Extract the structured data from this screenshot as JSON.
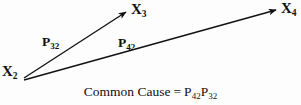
{
  "figure": {
    "background_color": "#fdfdfd",
    "ink_color": "#111111",
    "width": 301,
    "height": 105
  },
  "nodes": [
    {
      "id": "x2",
      "base": "X",
      "subscript": "2",
      "x": 2,
      "y": 64
    },
    {
      "id": "x3",
      "base": "X",
      "subscript": "3",
      "x": 131,
      "y": 2
    },
    {
      "id": "x4",
      "base": "X",
      "subscript": "4",
      "x": 281,
      "y": 1
    }
  ],
  "edges": [
    {
      "id": "edge-x2-x3",
      "label_base": "P",
      "label_subscript": "32",
      "from": "x2",
      "to": "x3",
      "x1": 24,
      "y1": 78,
      "x2": 126,
      "y2": 12,
      "arrowhead": true,
      "label_x": 42,
      "label_y": 35
    },
    {
      "id": "edge-x2-x4",
      "label_base": "P",
      "label_subscript": "42",
      "from": "x2",
      "to": "x4",
      "x1": 24,
      "y1": 80,
      "x2": 276,
      "y2": 10,
      "arrowhead": true,
      "label_x": 118,
      "label_y": 36
    }
  ],
  "caption": {
    "text": "Common Cause",
    "equals": "=",
    "term1_base": "P",
    "term1_subscript": "42",
    "term2_base": "P",
    "term2_subscript": "32"
  }
}
